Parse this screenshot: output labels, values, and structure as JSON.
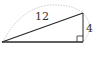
{
  "diagram": {
    "type": "right-triangle",
    "labels": {
      "hypotenuse": "12",
      "vertical_leg": "4"
    },
    "colors": {
      "stroke": "#2a2a2a",
      "arc": "#bbbbbb",
      "text": "#333333",
      "background": "#ffffff"
    }
  }
}
